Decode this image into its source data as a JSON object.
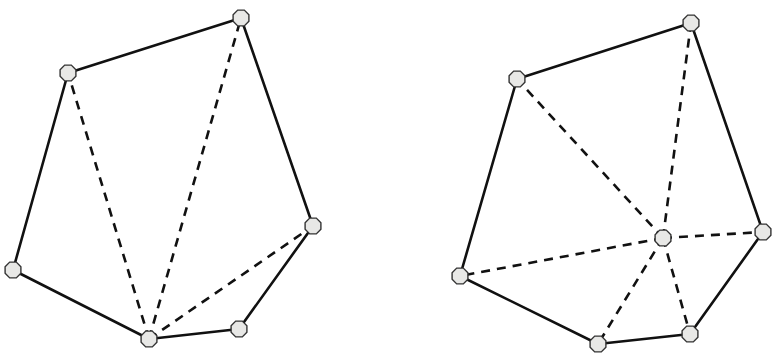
{
  "colors": {
    "background": "#ffffff",
    "line": "#111111",
    "vertex_fill": "#e8e8e6",
    "vertex_stroke": "#333333"
  },
  "diagrams": [
    {
      "name": "fan-triangulation",
      "vertices": [
        {
          "x": 68,
          "y": 73
        },
        {
          "x": 241,
          "y": 18
        },
        {
          "x": 313,
          "y": 226
        },
        {
          "x": 239,
          "y": 329
        },
        {
          "x": 149,
          "y": 339
        },
        {
          "x": 13,
          "y": 270
        }
      ],
      "hull_order": [
        0,
        1,
        2,
        3,
        4,
        5
      ],
      "dashed_diagonals": [
        [
          4,
          0
        ],
        [
          4,
          1
        ],
        [
          4,
          2
        ]
      ]
    },
    {
      "name": "star-triangulation",
      "vertices": [
        {
          "x": 517,
          "y": 79
        },
        {
          "x": 691,
          "y": 23
        },
        {
          "x": 763,
          "y": 232
        },
        {
          "x": 690,
          "y": 334
        },
        {
          "x": 598,
          "y": 344
        },
        {
          "x": 460,
          "y": 276
        }
      ],
      "hull_order": [
        0,
        1,
        2,
        3,
        4,
        5
      ],
      "interior_point": {
        "x": 663,
        "y": 238
      },
      "dashed_spokes_to": [
        0,
        1,
        2,
        3,
        4,
        5
      ]
    }
  ]
}
